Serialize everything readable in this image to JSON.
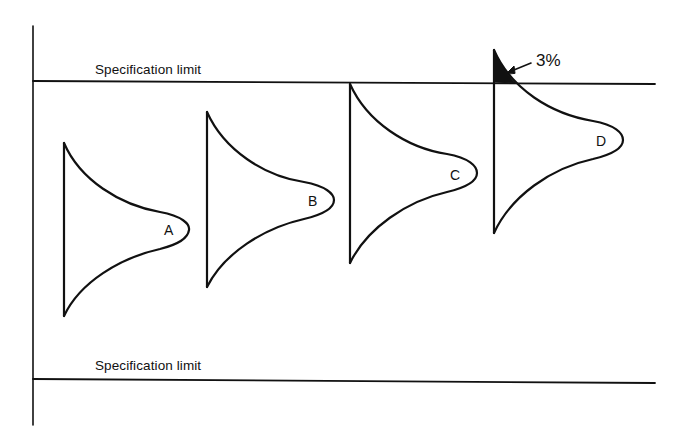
{
  "diagram": {
    "type": "process-capability-distributions",
    "upper_limit_label": "Specification limit",
    "lower_limit_label": "Specification limit",
    "annotation": "3%",
    "colors": {
      "ink": "#111111",
      "background": "#ffffff"
    },
    "distributions": [
      {
        "id": "A",
        "label": "A"
      },
      {
        "id": "B",
        "label": "B"
      },
      {
        "id": "C",
        "label": "C"
      },
      {
        "id": "D",
        "label": "D"
      }
    ]
  }
}
